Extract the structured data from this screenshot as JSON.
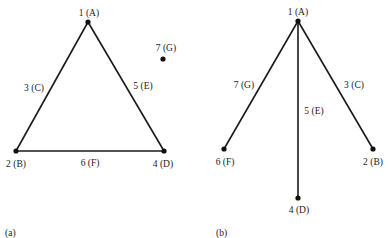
{
  "figures": [
    {
      "caption": "(a)",
      "nodes": [
        {
          "id": "A",
          "label": "1 (A)",
          "x": 88,
          "y": 22,
          "lx": 89,
          "ly": 16
        },
        {
          "id": "B",
          "label": "2 (B)",
          "x": 16,
          "y": 151,
          "lx": 16,
          "ly": 167
        },
        {
          "id": "D",
          "label": "4 (D)",
          "x": 164,
          "y": 151,
          "lx": 163,
          "ly": 167
        },
        {
          "id": "G",
          "label": "7 (G)",
          "x": 163,
          "y": 59,
          "lx": 166,
          "ly": 51
        }
      ],
      "edges": [
        {
          "from": "A",
          "to": "B",
          "label": "3 (C)",
          "lx": 34,
          "ly": 91
        },
        {
          "from": "A",
          "to": "D",
          "label": "5 (E)",
          "lx": 143,
          "ly": 89
        },
        {
          "from": "B",
          "to": "D",
          "label": "6 (F)",
          "lx": 90,
          "ly": 166
        }
      ]
    },
    {
      "caption": "(b)",
      "nodes": [
        {
          "id": "A",
          "label": "1 (A)",
          "x": 298,
          "y": 21,
          "lx": 298,
          "ly": 15
        },
        {
          "id": "F",
          "label": "6 (F)",
          "x": 224,
          "y": 149,
          "lx": 225,
          "ly": 165
        },
        {
          "id": "D",
          "label": "4 (D)",
          "x": 298,
          "y": 198,
          "lx": 299,
          "ly": 213
        },
        {
          "id": "B",
          "label": "2 (B)",
          "x": 373,
          "y": 149,
          "lx": 373,
          "ly": 165
        }
      ],
      "edges": [
        {
          "from": "A",
          "to": "F",
          "label": "7 (G)",
          "lx": 244,
          "ly": 88
        },
        {
          "from": "A",
          "to": "D",
          "label": "5 (E)",
          "lx": 314,
          "ly": 114
        },
        {
          "from": "A",
          "to": "B",
          "label": "3 (C)",
          "lx": 354,
          "ly": 88
        }
      ]
    }
  ],
  "captions": {
    "a": "(a)",
    "b": "(b)"
  }
}
